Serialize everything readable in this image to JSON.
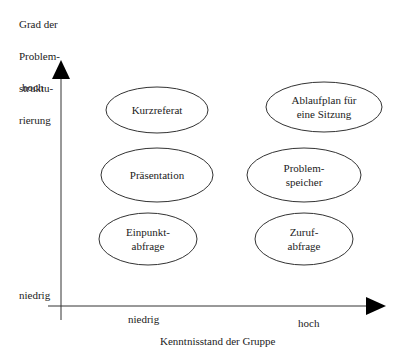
{
  "y_axis": {
    "title_lines": [
      "Grad der",
      "Problem-",
      "struktu-",
      "rierung"
    ],
    "high_label": "hoch",
    "low_label": "niedrig"
  },
  "x_axis": {
    "title": "Kenntnisstand der Gruppe",
    "low_label": "niedrig",
    "high_label": "hoch"
  },
  "items": [
    {
      "lines": [
        "Kurzreferat"
      ],
      "knowledge": "niedrig",
      "structure": "hoch"
    },
    {
      "lines": [
        "Ablaufplan für",
        "eine Sitzung"
      ],
      "knowledge": "hoch",
      "structure": "hoch"
    },
    {
      "lines": [
        "Präsentation"
      ],
      "knowledge": "niedrig",
      "structure": "mittel"
    },
    {
      "lines": [
        "Problem-",
        "speicher"
      ],
      "knowledge": "hoch",
      "structure": "mittel"
    },
    {
      "lines": [
        "Einpunkt-",
        "abfrage"
      ],
      "knowledge": "niedrig",
      "structure": "niedrig"
    },
    {
      "lines": [
        "Zuruf-",
        "abfrage"
      ],
      "knowledge": "hoch",
      "structure": "niedrig"
    }
  ],
  "colors": {
    "stroke": "#333333",
    "arrow": "#000000",
    "text": "#222222"
  }
}
